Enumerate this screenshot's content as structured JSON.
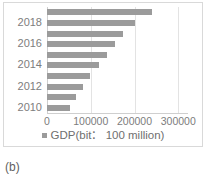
{
  "caption": "(b)",
  "legend": {
    "marker": "square-marker",
    "label": "GDP(bit： 100 million)",
    "color": "#9b9b9b"
  },
  "chart_data": {
    "type": "bar",
    "orientation": "horizontal",
    "title": "",
    "xlabel": "",
    "ylabel": "",
    "categories": [
      "2010",
      "2011",
      "2012",
      "2013",
      "2014",
      "2015",
      "2016",
      "2017",
      "2018",
      "2019"
    ],
    "values": [
      52000,
      67000,
      82000,
      99000,
      119000,
      138000,
      155000,
      174000,
      202000,
      241000
    ],
    "series": [
      {
        "name": "GDP(bit： 100 million)",
        "color": "#9b9b9b",
        "values": [
          52000,
          67000,
          82000,
          99000,
          119000,
          138000,
          155000,
          174000,
          202000,
          241000
        ]
      }
    ],
    "xlim": [
      0,
      320000
    ],
    "ylim_categories": 10,
    "xticks": [
      0,
      100000,
      200000,
      300000
    ],
    "xtick_labels": [
      "0",
      "100000",
      "200000",
      "300000"
    ],
    "yticks_shown": [
      "2010",
      "2012",
      "2014",
      "2016",
      "2018"
    ],
    "ytick_labels": [
      "2018",
      "2016",
      "2014",
      "2012",
      "2010"
    ],
    "grid": "vertical",
    "legend_position": "bottom-center",
    "bar_color": "#9b9b9b",
    "grid_color": "#e3e3e3",
    "axis_color": "#cfcfcf",
    "text_color": "#7d7d7d"
  }
}
